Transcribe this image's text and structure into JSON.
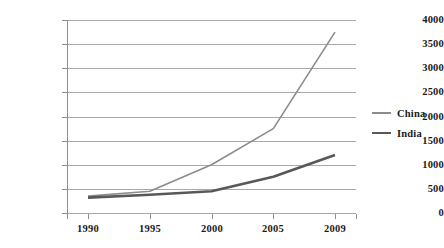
{
  "chart_data": {
    "type": "line",
    "title": "",
    "subtitle": "",
    "xlabel": "",
    "ylabel": "",
    "categories": [
      "1990",
      "1995",
      "2000",
      "2005",
      "2009"
    ],
    "series": [
      {
        "name": "China",
        "values": [
          350,
          450,
          1000,
          1750,
          3750
        ],
        "color": "#8c8c8c",
        "line_width": 1.6
      },
      {
        "name": "India",
        "values": [
          320,
          380,
          450,
          750,
          1200
        ],
        "color": "#585858",
        "line_width": 2.6
      }
    ],
    "ylim": [
      0,
      4000
    ],
    "yticks": [
      0,
      500,
      1000,
      1500,
      2000,
      2500,
      3000,
      3500,
      4000
    ],
    "ytick_labels": [
      "0",
      "500",
      "1000",
      "1500",
      "2000",
      "2500",
      "3000",
      "3500",
      "4000"
    ],
    "grid": true,
    "grid_axis": "y",
    "grid_color": "#a9a9a9",
    "legend_position": "right",
    "legend_entries": [
      "China",
      "India"
    ],
    "background": "#ffffff",
    "axis_color": "#8d8d8d",
    "text_color": "#1a1a1a"
  }
}
